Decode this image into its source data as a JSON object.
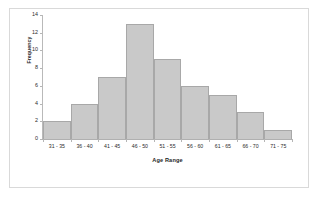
{
  "chart_data": {
    "type": "bar",
    "title": "",
    "subtitle": "",
    "xlabel": "Age Range",
    "ylabel": "Frequency",
    "categories": [
      "31 - 35",
      "36 - 40",
      "41 - 45",
      "46 - 50",
      "51 - 55",
      "56 - 60",
      "61 - 65",
      "66 - 70",
      "71 - 75"
    ],
    "values": [
      2,
      4,
      7,
      13,
      9,
      6,
      5,
      3,
      1
    ],
    "ylim": [
      0,
      14
    ],
    "ytick_labels": [
      "14",
      "12",
      "10",
      "8",
      "6",
      "4",
      "2",
      "0"
    ],
    "ytick_values": [
      14,
      12,
      10,
      8,
      6,
      4,
      2,
      0
    ],
    "ystep": 2,
    "grid": false,
    "legend": "none",
    "bar_gap": "none",
    "colors": {
      "bar_fill": "#c9c9c9",
      "bar_border": "#a8a8a8",
      "axis_line": "#b5b5b5",
      "text": "#2b2b2b",
      "frame_border": "#d9d9d9",
      "background": "#ffffff"
    }
  }
}
